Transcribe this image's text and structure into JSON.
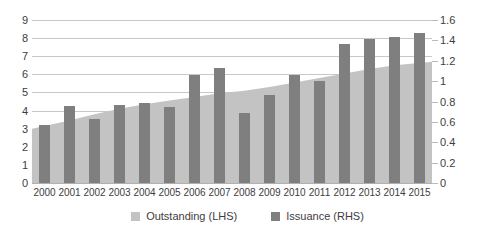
{
  "chart_data": {
    "type": "area",
    "title": "",
    "xlabel": "",
    "ylabel": "",
    "grid": true,
    "legend_position": "bottom-center",
    "categories": [
      "2000",
      "2001",
      "2002",
      "2003",
      "2004",
      "2005",
      "2006",
      "2007",
      "2008",
      "2009",
      "2010",
      "2011",
      "2012",
      "2013",
      "2014",
      "2015"
    ],
    "axes": {
      "left": {
        "label": "",
        "min": 0,
        "max": 9,
        "step": 1,
        "ticks": [
          "0",
          "1",
          "2",
          "3",
          "4",
          "5",
          "6",
          "7",
          "8",
          "9"
        ]
      },
      "right": {
        "label": "",
        "min": 0,
        "max": 1.6,
        "step": 0.2,
        "ticks": [
          "0",
          "0.2",
          "0.4",
          "0.6",
          "0.8",
          "1",
          "1.2",
          "1.4",
          "1.6"
        ]
      }
    },
    "series": [
      {
        "name": "Outstanding (LHS)",
        "type": "area",
        "axis": "left",
        "color": "#c3c3c3",
        "values": [
          3.0,
          3.45,
          3.8,
          4.1,
          4.35,
          4.55,
          4.75,
          4.95,
          5.1,
          5.3,
          5.55,
          5.8,
          6.05,
          6.3,
          6.5,
          6.7
        ]
      },
      {
        "name": "Issuance (RHS)",
        "type": "bar",
        "axis": "right",
        "color": "#7f7f7f",
        "values": [
          0.57,
          0.76,
          0.63,
          0.77,
          0.79,
          0.75,
          1.06,
          1.13,
          0.69,
          0.86,
          1.06,
          1.0,
          1.36,
          1.41,
          1.43,
          1.47
        ]
      }
    ]
  },
  "legend": {
    "items": [
      {
        "label": "Outstanding (LHS)",
        "color": "#c3c3c3"
      },
      {
        "label": "Issuance (RHS)",
        "color": "#7f7f7f"
      }
    ]
  },
  "colors": {
    "area": "#c3c3c3",
    "bar": "#7f7f7f",
    "gridline": "#c8c8c8",
    "text": "#3d3d3d",
    "background": "#ffffff"
  }
}
